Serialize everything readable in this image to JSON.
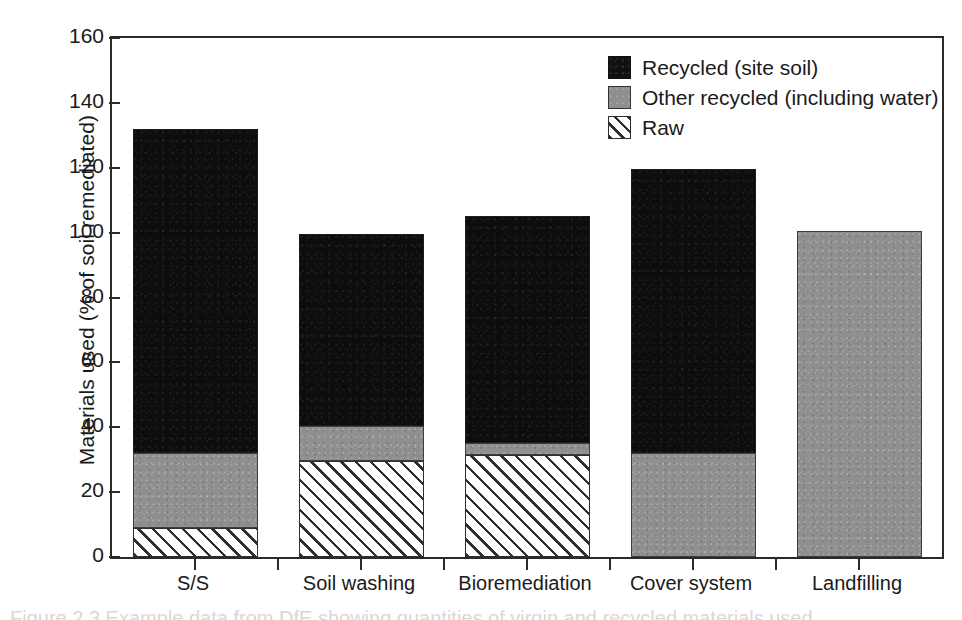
{
  "figure": {
    "caption": "Figure 2.3   Example data from DfE showing quantities of virgin and recycled materials used"
  },
  "chart_data": {
    "type": "bar",
    "subtype": "stacked-vertical",
    "title": "",
    "xlabel": "",
    "ylabel": "Materials used (% of soil remediated)",
    "ylim": [
      0,
      160
    ],
    "yticks": [
      0,
      20,
      40,
      60,
      80,
      100,
      120,
      140,
      160
    ],
    "ytick_labels": [
      "0",
      "20",
      "40",
      "60",
      "80",
      "100",
      "120",
      "140",
      "160"
    ],
    "grid": false,
    "legend_position": "top-right-inside",
    "categories": [
      "S/S",
      "Soil washing",
      "Bioremediation",
      "Cover system",
      "Landfilling"
    ],
    "stack_order_bottom_to_top": [
      "Raw",
      "Other recycled (including water)",
      "Recycled (site soil)"
    ],
    "series": [
      {
        "name": "Recycled (site soil)",
        "fill": "solid-black",
        "color": "#111111",
        "values": [
          100.0,
          59.0,
          70.0,
          87.5,
          0.0
        ]
      },
      {
        "name": "Other recycled (including water)",
        "fill": "solid-gray",
        "color": "#8f8f8f",
        "values": [
          23.0,
          11.0,
          3.5,
          32.0,
          100.5
        ]
      },
      {
        "name": "Raw",
        "fill": "diagonal-hatch",
        "color": "#ffffff",
        "values": [
          9.0,
          29.5,
          31.5,
          0.0,
          0.0
        ]
      }
    ],
    "totals": [
      132.0,
      99.5,
      105.0,
      119.5,
      100.5
    ]
  },
  "legend": {
    "items": [
      {
        "label": "Recycled (site soil)",
        "swatch": "solid-black-swatch"
      },
      {
        "label": "Other recycled (including water)",
        "swatch": "solid-gray-swatch"
      },
      {
        "label": "Raw",
        "swatch": "diagonal-hatch-swatch"
      }
    ]
  }
}
